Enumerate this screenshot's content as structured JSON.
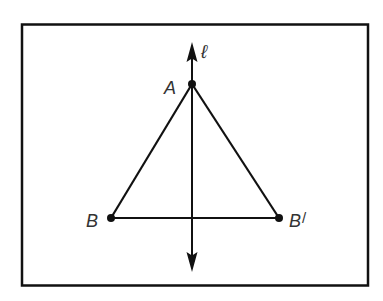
{
  "diagram": {
    "type": "geometry-reflection",
    "colors": {
      "stroke": "#111111",
      "label": "#333333",
      "frame": "#111111",
      "background": "#ffffff"
    },
    "line": {
      "name": "l",
      "label": "ℓ",
      "x": 192,
      "y_top": 42,
      "y_bottom": 272
    },
    "points": [
      {
        "id": "A",
        "label": "A",
        "x": 192,
        "y": 84,
        "label_x": 164,
        "label_y": 94
      },
      {
        "id": "B",
        "label": "B",
        "x": 111,
        "y": 218,
        "label_x": 86,
        "label_y": 227
      },
      {
        "id": "Bp",
        "label": "B",
        "prime": "/",
        "x": 279,
        "y": 218,
        "label_x": 289,
        "label_y": 227
      }
    ],
    "segments": [
      {
        "from": "A",
        "to": "B"
      },
      {
        "from": "A",
        "to": "Bp"
      },
      {
        "from": "B",
        "to": "Bp"
      }
    ],
    "frame": {
      "x": 21,
      "y": 24,
      "width": 347,
      "height": 262
    }
  }
}
